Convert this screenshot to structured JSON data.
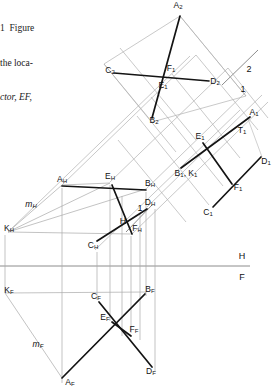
{
  "figure": {
    "type": "descriptive-geometry-multiview",
    "caption_bleed": {
      "lines": [
        "1  Figure",
        "the loca-",
        "ctor, EF,"
      ]
    },
    "fold_lines": [
      {
        "name": "H-F",
        "upper": "H",
        "lower": "F"
      },
      {
        "name": "H-1",
        "upper": "H",
        "lower": "1"
      },
      {
        "name": "2-1",
        "upper": "2",
        "lower": "1"
      }
    ],
    "views": {
      "horizontal": {
        "name": "H",
        "labels": [
          {
            "id": "A_H",
            "base": "A",
            "sub": "H",
            "x": 62,
            "y": 180
          },
          {
            "id": "E_H",
            "base": "E",
            "sub": "H",
            "x": 110,
            "y": 177
          },
          {
            "id": "B_H",
            "base": "B",
            "sub": "H",
            "x": 146,
            "y": 184
          },
          {
            "id": "D_H",
            "base": "D",
            "sub": "H",
            "x": 147,
            "y": 203
          },
          {
            "id": "F_H",
            "base": "F",
            "sub": "H",
            "x": 134,
            "y": 229
          },
          {
            "id": "C_H",
            "base": "C",
            "sub": "H",
            "x": 93,
            "y": 246
          },
          {
            "id": "K_H",
            "base": "K",
            "sub": "H",
            "x": 9,
            "y": 229
          },
          {
            "id": "m_H",
            "base": "m",
            "sub": "H",
            "x": 31,
            "y": 205,
            "italic": true
          }
        ]
      },
      "frontal": {
        "name": "F",
        "labels": [
          {
            "id": "K_F",
            "base": "K",
            "sub": "F",
            "x": 9,
            "y": 291
          },
          {
            "id": "C_F",
            "base": "C",
            "sub": "F",
            "x": 96,
            "y": 297
          },
          {
            "id": "B_F",
            "base": "B",
            "sub": "F",
            "x": 146,
            "y": 290
          },
          {
            "id": "E_F",
            "base": "E",
            "sub": "F",
            "x": 105,
            "y": 318
          },
          {
            "id": "F_F",
            "base": "F",
            "sub": "F",
            "x": 132,
            "y": 330
          },
          {
            "id": "m_F",
            "base": "m",
            "sub": "F",
            "x": 38,
            "y": 345,
            "italic": true
          },
          {
            "id": "A_F",
            "base": "A",
            "sub": "F",
            "x": 70,
            "y": 383
          },
          {
            "id": "D_F",
            "base": "D",
            "sub": "F",
            "x": 149,
            "y": 372
          }
        ]
      },
      "auxiliary_1": {
        "name": "1",
        "labels": [
          {
            "id": "A_1",
            "base": "A",
            "sub": "1",
            "x": 254,
            "y": 113
          },
          {
            "id": "T_1",
            "base": "T",
            "sub": "1",
            "x": 242,
            "y": 131
          },
          {
            "id": "E_1",
            "base": "E",
            "sub": "1",
            "x": 200,
            "y": 137
          },
          {
            "id": "D_1",
            "base": "D",
            "sub": "1",
            "x": 266,
            "y": 162
          },
          {
            "id": "B1_K1",
            "base": "B",
            "sub": "1",
            "x": 186,
            "y": 174,
            "text2": "K",
            "sub2": "1"
          },
          {
            "id": "F_1",
            "base": "F",
            "sub": "1",
            "x": 238,
            "y": 188
          },
          {
            "id": "C_1",
            "base": "C",
            "sub": "1",
            "x": 208,
            "y": 213
          }
        ]
      },
      "auxiliary_2": {
        "name": "2",
        "labels": [
          {
            "id": "A_2",
            "base": "A",
            "sub": "2",
            "x": 178,
            "y": 6
          },
          {
            "id": "C_2",
            "base": "C",
            "sub": "2",
            "x": 110,
            "y": 71
          },
          {
            "id": "F_1_v2",
            "base": "F",
            "sub": "1",
            "x": 171,
            "y": 69
          },
          {
            "id": "D_2",
            "base": "D",
            "sub": "2",
            "x": 215,
            "y": 82
          },
          {
            "id": "E_1_v2",
            "base": "E",
            "sub": "1",
            "x": 163,
            "y": 86
          },
          {
            "id": "B_2",
            "base": "B",
            "sub": "2",
            "x": 154,
            "y": 121
          }
        ]
      }
    },
    "colors": {
      "heavy_line": "#1a1a1a",
      "light_line": "#8c8c8c",
      "projector": "#a8a8a8",
      "fold_line": "#707070"
    }
  }
}
